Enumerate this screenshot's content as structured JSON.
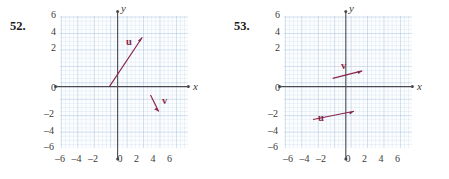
{
  "page": {
    "background": "#ffffff",
    "vector_color": "#8a2449",
    "axis_color": "#4b4b52",
    "grid_color": "#96b4d7",
    "tick_label_color": "#3a3a3a"
  },
  "problems": [
    {
      "number": "52.",
      "axes": {
        "x_label": "x",
        "y_label": "y",
        "x_ticks": [
          "–6",
          "–4",
          "–2",
          "0",
          "2",
          "4",
          "6"
        ],
        "x_tick_values": [
          -6,
          -4,
          -2,
          0,
          2,
          4,
          6
        ],
        "y_ticks": [
          "6",
          "4",
          "2",
          "0",
          "–2",
          "–4",
          "–6"
        ],
        "y_tick_values": [
          6,
          4,
          2,
          0,
          -2,
          -4,
          -6
        ],
        "x_range": [
          -7.3,
          7.3
        ],
        "y_range": [
          -7.6,
          7.6
        ],
        "grid": true,
        "grid_minor_step": 0.5,
        "grid_major_step": 2
      },
      "vectors": [
        {
          "name": "u",
          "label": "u",
          "tail": [
            -1,
            0
          ],
          "head": [
            3,
            6
          ],
          "label_pos": [
            0.7,
            4.3
          ]
        },
        {
          "name": "v",
          "label": "v",
          "tail": [
            4,
            -1
          ],
          "head": [
            5,
            -3
          ],
          "label_pos": [
            5.3,
            -1.6
          ]
        }
      ]
    },
    {
      "number": "53.",
      "axes": {
        "x_label": "x",
        "y_label": "y",
        "x_ticks": [
          "–6",
          "–4",
          "–2",
          "0",
          "2",
          "4",
          "6"
        ],
        "x_tick_values": [
          -6,
          -4,
          -2,
          0,
          2,
          4,
          6
        ],
        "y_ticks": [
          "6",
          "4",
          "2",
          "0",
          "–2",
          "–4",
          "–6"
        ],
        "y_tick_values": [
          6,
          4,
          2,
          0,
          -2,
          -4,
          -6
        ],
        "x_range": [
          -7.3,
          7.3
        ],
        "y_range": [
          -7.6,
          7.6
        ],
        "grid": true,
        "grid_minor_step": 0.5,
        "grid_major_step": 2
      },
      "vectors": [
        {
          "name": "v",
          "label": "v",
          "tail": [
            -1.6,
            1.0
          ],
          "head": [
            2.0,
            1.9
          ],
          "label_pos": [
            0.0,
            2.7
          ]
        },
        {
          "name": "u",
          "label": "u",
          "tail": [
            -4.0,
            -4.0
          ],
          "head": [
            1.0,
            -3.0
          ],
          "label_pos": [
            -2.3,
            -2.2
          ]
        }
      ]
    }
  ]
}
